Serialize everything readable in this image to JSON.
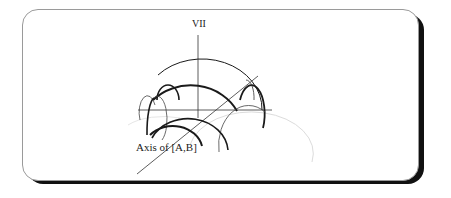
{
  "diagram": {
    "labels": {
      "vertical_axis": "VII",
      "diagonal_axis": "Axis of [A,B]"
    },
    "colors": {
      "stroke": "#1a1a1a",
      "thin_stroke": "#333333",
      "faint_stroke": "#d8d8d8",
      "frame_border": "#9a9a9a",
      "frame_shadow": "#111111"
    }
  }
}
